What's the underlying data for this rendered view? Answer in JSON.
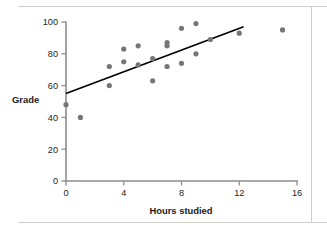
{
  "figure": {
    "frame_color": "#d2cfc9"
  },
  "chart_data": {
    "type": "scatter",
    "title": "",
    "xlabel": "Hours studied",
    "ylabel": "Grade",
    "xlim": [
      0,
      16
    ],
    "ylim": [
      0,
      100
    ],
    "xticks": [
      0,
      4,
      8,
      12,
      16
    ],
    "yticks": [
      0,
      20,
      40,
      60,
      80,
      100
    ],
    "xtick_labels": [
      "0",
      "4",
      "8",
      "12",
      "16"
    ],
    "ytick_labels": [
      "0",
      "20",
      "40",
      "60",
      "80",
      "100"
    ],
    "grid": false,
    "legend": false,
    "point_color": "#767676",
    "point_radius": 2.6,
    "axis_color": "#8d8d8d",
    "points": [
      {
        "x": 0,
        "y": 48
      },
      {
        "x": 1,
        "y": 40
      },
      {
        "x": 3,
        "y": 72
      },
      {
        "x": 3,
        "y": 60
      },
      {
        "x": 4,
        "y": 83
      },
      {
        "x": 4,
        "y": 75
      },
      {
        "x": 5,
        "y": 85
      },
      {
        "x": 5,
        "y": 73
      },
      {
        "x": 6,
        "y": 77
      },
      {
        "x": 6,
        "y": 63
      },
      {
        "x": 7,
        "y": 87
      },
      {
        "x": 7,
        "y": 85
      },
      {
        "x": 7,
        "y": 72
      },
      {
        "x": 8,
        "y": 96
      },
      {
        "x": 8,
        "y": 74
      },
      {
        "x": 9,
        "y": 99
      },
      {
        "x": 9,
        "y": 80
      },
      {
        "x": 10,
        "y": 89
      },
      {
        "x": 12,
        "y": 93
      },
      {
        "x": 15,
        "y": 95
      }
    ],
    "trendline": {
      "type": "linear-fit",
      "color": "#000000",
      "x_start": 0,
      "y_start": 55,
      "x_end": 12.3,
      "y_end": 97
    }
  }
}
